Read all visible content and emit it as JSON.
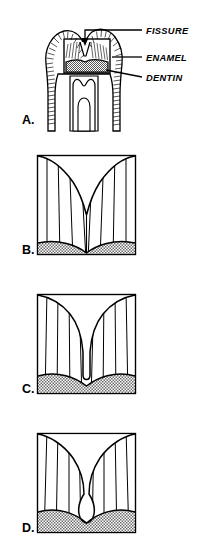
{
  "figure": {
    "background_color": "#ffffff",
    "line_color": "#000000",
    "dentin_fill_color": "#c8c8c8",
    "enamel_fill_color": "#ffffff"
  },
  "callouts": [
    {
      "id": "fissure",
      "label": "FISSURE",
      "x": 146,
      "y": 37
    },
    {
      "id": "enamel",
      "label": "ENAMEL",
      "x": 146,
      "y": 60
    },
    {
      "id": "dentin",
      "label": "DENTIN",
      "x": 146,
      "y": 80
    }
  ],
  "panels": [
    {
      "id": "a",
      "letter": "A.",
      "letter_x": 22,
      "letter_y": 124,
      "caption": "Whole tooth cross-section showing fissure, enamel and dentin"
    },
    {
      "id": "b",
      "letter": "B.",
      "letter_x": 22,
      "letter_y": 254,
      "caption": "Wide V-shaped fissure"
    },
    {
      "id": "c",
      "letter": "C.",
      "letter_x": 22,
      "letter_y": 393,
      "caption": "Narrow deep fissure"
    },
    {
      "id": "d",
      "letter": "D.",
      "letter_x": 22,
      "letter_y": 532,
      "caption": "Constricted-neck flask-shaped fissure"
    }
  ],
  "boxes": {
    "b": {
      "x": 37,
      "y": 155,
      "width": 99,
      "height": 100
    },
    "c": {
      "x": 37,
      "y": 294,
      "width": 99,
      "height": 100
    },
    "d": {
      "x": 37,
      "y": 433,
      "width": 99,
      "height": 100
    }
  }
}
